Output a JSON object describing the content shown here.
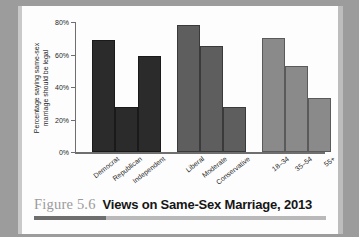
{
  "caption": {
    "figure_number": "Figure 5.6",
    "title": "Views on Same-Sex Marriage, 2013"
  },
  "chart_data": {
    "type": "bar",
    "title": "Views on Same-Sex Marriage, 2013",
    "xlabel": "",
    "ylabel": "Percentage saying same-sex marriage should be legal",
    "ylabel_line1": "Percentage saying same-sex",
    "ylabel_line2": "marriage should be legal",
    "ylim": [
      0,
      80
    ],
    "ytick_labels": [
      "0%",
      "20%",
      "40%",
      "60%",
      "80%"
    ],
    "ytick_values": [
      0,
      20,
      40,
      60,
      80
    ],
    "grid": false,
    "legend": "none",
    "categories": [
      "Democrat",
      "Republican",
      "Independent",
      "Liberal",
      "Moderate",
      "Conservative",
      "18–34",
      "35–54",
      "55+"
    ],
    "values": [
      69,
      28,
      59,
      78,
      65,
      28,
      70,
      53,
      33
    ],
    "groups": [
      {
        "name": "Party identification",
        "color": "#2b2b2b",
        "categories": [
          "Democrat",
          "Republican",
          "Independent"
        ],
        "values": [
          69,
          28,
          59
        ]
      },
      {
        "name": "Ideology",
        "color": "#5e5e5e",
        "categories": [
          "Liberal",
          "Moderate",
          "Conservative"
        ],
        "values": [
          78,
          65,
          28
        ]
      },
      {
        "name": "Age",
        "color": "#8a8a8a",
        "categories": [
          "18–34",
          "35–54",
          "55+"
        ],
        "values": [
          70,
          53,
          33
        ]
      }
    ]
  }
}
